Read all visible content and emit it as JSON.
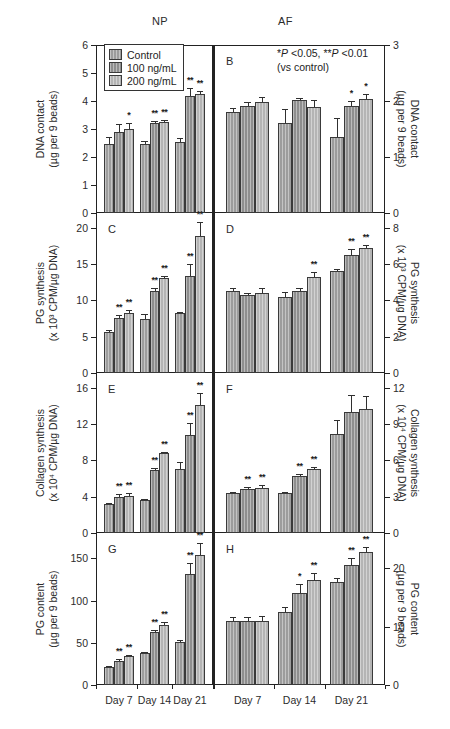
{
  "figure": {
    "groups": [
      {
        "name": "NP",
        "label": "NP"
      },
      {
        "name": "AF",
        "label": "AF"
      }
    ],
    "legend": {
      "items": [
        {
          "label": "Control",
          "color": "#9c9c9c"
        },
        {
          "label": "100 ng/mL",
          "color": "#8e8e8e"
        },
        {
          "label": "200 ng/mL",
          "color": "#b4b4b4"
        }
      ]
    },
    "significance_note": {
      "line1_pre": "*",
      "line1_p1": "P",
      "line1_mid": " <0.05, **",
      "line1_p2": "P",
      "line1_post": " <0.01",
      "line1_full": "*P <0.05, **P <0.01",
      "line2": "(vs control)"
    },
    "x_categories": [
      "Day 7",
      "Day 14",
      "Day 21"
    ]
  },
  "chart_data": [
    {
      "type": "bar",
      "panel": "A",
      "group": "NP",
      "title": "",
      "ylabel": "DNA contact\n(µg per 9 beads)",
      "ylabel_line1": "DNA contact",
      "ylabel_line2": "(µg per 9 beads)",
      "xlabel": "",
      "ylim": [
        0,
        6
      ],
      "yticks": [
        0,
        1,
        2,
        3,
        4,
        5,
        6
      ],
      "categories": [
        "Day 7",
        "Day 14",
        "Day 21"
      ],
      "series": [
        {
          "name": "Control",
          "values": [
            2.45,
            2.48,
            2.55
          ],
          "errors": [
            0.28,
            0.1,
            0.12
          ],
          "sig": [
            "",
            "",
            ""
          ]
        },
        {
          "name": "100 ng/mL",
          "values": [
            2.88,
            3.22,
            4.18
          ],
          "errors": [
            0.3,
            0.08,
            0.28
          ],
          "sig": [
            "",
            "**",
            "**"
          ]
        },
        {
          "name": "200 ng/mL",
          "values": [
            3.0,
            3.24,
            4.25
          ],
          "errors": [
            0.22,
            0.08,
            0.12
          ],
          "sig": [
            "*",
            "**",
            "**"
          ]
        }
      ]
    },
    {
      "type": "bar",
      "panel": "B",
      "group": "AF",
      "title": "",
      "ylabel_line1": "DNA contact",
      "ylabel_line2": "(µg per 9 beads)",
      "ylim": [
        0,
        3
      ],
      "yticks": [
        0,
        1,
        2,
        3
      ],
      "categories": [
        "Day 7",
        "Day 14",
        "Day 21"
      ],
      "series": [
        {
          "name": "Control",
          "values": [
            1.8,
            1.6,
            1.35
          ],
          "errors": [
            0.07,
            0.26,
            0.34
          ],
          "sig": [
            "",
            "",
            ""
          ]
        },
        {
          "name": "100 ng/mL",
          "values": [
            1.91,
            2.02,
            1.91
          ],
          "errors": [
            0.07,
            0.03,
            0.09
          ],
          "sig": [
            "",
            "",
            "*"
          ]
        },
        {
          "name": "200 ng/mL",
          "values": [
            1.98,
            1.89,
            2.03
          ],
          "errors": [
            0.09,
            0.12,
            0.09
          ],
          "sig": [
            "",
            "",
            "*"
          ]
        }
      ]
    },
    {
      "type": "bar",
      "panel": "C",
      "group": "NP",
      "ylabel_line1": "PG synthesis",
      "ylabel_line2": "(x 10³ CPM/µg DNA)",
      "ylim": [
        0,
        22
      ],
      "yticks": [
        0,
        5,
        10,
        15,
        20
      ],
      "categories": [
        "Day 7",
        "Day 14",
        "Day 21"
      ],
      "series": [
        {
          "name": "Control",
          "values": [
            5.7,
            7.4,
            8.2
          ],
          "errors": [
            0.25,
            0.7,
            0.2
          ],
          "sig": [
            "",
            "",
            ""
          ]
        },
        {
          "name": "100 ng/mL",
          "values": [
            7.5,
            11.3,
            13.3
          ],
          "errors": [
            0.5,
            0.35,
            1.7
          ],
          "sig": [
            "**",
            "**",
            "**"
          ]
        },
        {
          "name": "200 ng/mL",
          "values": [
            8.2,
            13.0,
            18.9
          ],
          "errors": [
            0.45,
            0.35,
            1.8
          ],
          "sig": [
            "**",
            "**",
            "**"
          ]
        }
      ]
    },
    {
      "type": "bar",
      "panel": "D",
      "group": "AF",
      "ylabel_line1": "PG synthesis",
      "ylabel_line2": "(x 10³ CPM/µg DNA)",
      "ylim": [
        0,
        8.8
      ],
      "yticks": [
        0,
        2,
        4,
        6,
        8
      ],
      "categories": [
        "Day 7",
        "Day 14",
        "Day 21"
      ],
      "series": [
        {
          "name": "Control",
          "values": [
            4.5,
            4.2,
            5.6
          ],
          "errors": [
            0.18,
            0.28,
            0.1
          ],
          "sig": [
            "",
            "",
            ""
          ]
        },
        {
          "name": "100 ng/mL",
          "values": [
            4.3,
            4.5,
            6.5
          ],
          "errors": [
            0.1,
            0.18,
            0.3
          ],
          "sig": [
            "",
            "",
            "**"
          ]
        },
        {
          "name": "200 ng/mL",
          "values": [
            4.4,
            5.3,
            6.9
          ],
          "errors": [
            0.25,
            0.25,
            0.15
          ],
          "sig": [
            "",
            "**",
            "**"
          ]
        }
      ]
    },
    {
      "type": "bar",
      "panel": "E",
      "group": "NP",
      "ylabel_line1": "Collagen synthesis",
      "ylabel_line2": "(x 10⁴ CPM/µg DNA)",
      "ylim": [
        0,
        17.6
      ],
      "yticks": [
        0,
        4,
        8,
        12,
        16
      ],
      "categories": [
        "Day 7",
        "Day 14",
        "Day 21"
      ],
      "series": [
        {
          "name": "Control",
          "values": [
            3.2,
            3.6,
            7.0
          ],
          "errors": [
            0.15,
            0.15,
            0.85
          ],
          "sig": [
            "",
            "",
            ""
          ]
        },
        {
          "name": "100 ng/mL",
          "values": [
            4.0,
            6.9,
            10.8
          ],
          "errors": [
            0.3,
            0.25,
            1.3
          ],
          "sig": [
            "**",
            "**",
            "**"
          ]
        },
        {
          "name": "200 ng/mL",
          "values": [
            4.1,
            8.8,
            14.1
          ],
          "errors": [
            0.25,
            0.12,
            1.3
          ],
          "sig": [
            "**",
            "**",
            "**"
          ]
        }
      ]
    },
    {
      "type": "bar",
      "panel": "F",
      "group": "AF",
      "ylabel_line1": "Collagen synthesis",
      "ylabel_line2": "(x 10⁴ CPM/µg DNA)",
      "ylim": [
        0,
        13.2
      ],
      "yticks": [
        0,
        3,
        6,
        9,
        12
      ],
      "categories": [
        "Day 7",
        "Day 14",
        "Day 21"
      ],
      "series": [
        {
          "name": "Control",
          "values": [
            3.3,
            3.3,
            8.2
          ],
          "errors": [
            0.12,
            0.12,
            1.1
          ],
          "sig": [
            "",
            "",
            ""
          ]
        },
        {
          "name": "100 ng/mL",
          "values": [
            3.6,
            4.7,
            10.0
          ],
          "errors": [
            0.22,
            0.18,
            1.35
          ],
          "sig": [
            "**",
            "**",
            ""
          ]
        },
        {
          "name": "200 ng/mL",
          "values": [
            3.7,
            5.3,
            10.2
          ],
          "errors": [
            0.25,
            0.15,
            1.1
          ],
          "sig": [
            "**",
            "**",
            ""
          ]
        }
      ]
    },
    {
      "type": "bar",
      "panel": "G",
      "group": "NP",
      "ylabel_line1": "PG content",
      "ylabel_line2": "(µg per 9 beads)",
      "ylim": [
        0,
        180
      ],
      "yticks": [
        0,
        50,
        100,
        150
      ],
      "categories": [
        "Day 7",
        "Day 14",
        "Day 21"
      ],
      "series": [
        {
          "name": "Control",
          "values": [
            21,
            38,
            51
          ],
          "errors": [
            1.5,
            1.5,
            2.5
          ],
          "sig": [
            "",
            "",
            ""
          ]
        },
        {
          "name": "100 ng/mL",
          "values": [
            29,
            63,
            132
          ],
          "errors": [
            1.5,
            2.0,
            12.0
          ],
          "sig": [
            "**",
            "**",
            "**"
          ]
        },
        {
          "name": "200 ng/mL",
          "values": [
            34,
            71,
            154
          ],
          "errors": [
            1.5,
            4.0,
            14.0
          ],
          "sig": [
            "**",
            "**",
            "**"
          ]
        }
      ]
    },
    {
      "type": "bar",
      "panel": "H",
      "group": "AF",
      "ylabel_line1": "PG content",
      "ylabel_line2": "(µg per 9 beads)",
      "ylim": [
        0,
        26
      ],
      "yticks": [
        0,
        10,
        20
      ],
      "categories": [
        "Day 7",
        "Day 14",
        "Day 21"
      ],
      "series": [
        {
          "name": "Control",
          "values": [
            11.0,
            12.5,
            17.7
          ],
          "errors": [
            0.6,
            0.8,
            0.6
          ],
          "sig": [
            "",
            "",
            ""
          ]
        },
        {
          "name": "100 ng/mL",
          "values": [
            11.0,
            15.8,
            20.6
          ],
          "errors": [
            0.6,
            1.5,
            1.1
          ],
          "sig": [
            "",
            "*",
            "**"
          ]
        },
        {
          "name": "200 ng/mL",
          "values": [
            11.0,
            17.9,
            22.7
          ],
          "errors": [
            0.8,
            1.2,
            0.9
          ],
          "sig": [
            "",
            "**",
            "**"
          ]
        }
      ]
    }
  ]
}
